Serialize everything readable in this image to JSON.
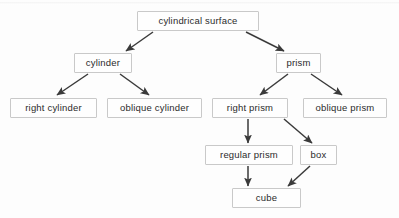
{
  "diagram": {
    "type": "hierarchy-flowchart",
    "background_color": "#fdfdfd",
    "box_border_color": "#c9c9c9",
    "box_fill_color": "#fefefe",
    "text_color": "#2b2b2b",
    "arrow_color": "#3a3a3a",
    "nodes": [
      {
        "id": "cylindrical-surface",
        "label": "cylindrical surface",
        "x": 137,
        "y": 11,
        "w": 122,
        "h": 20
      },
      {
        "id": "cylinder",
        "label": "cylinder",
        "x": 74,
        "y": 53,
        "w": 58,
        "h": 20
      },
      {
        "id": "prism",
        "label": "prism",
        "x": 276,
        "y": 53,
        "w": 45,
        "h": 20
      },
      {
        "id": "right-cylinder",
        "label": "right cylinder",
        "x": 10,
        "y": 98,
        "w": 87,
        "h": 20
      },
      {
        "id": "oblique-cylinder",
        "label": "oblique cylinder",
        "x": 107,
        "y": 98,
        "w": 95,
        "h": 20
      },
      {
        "id": "right-prism",
        "label": "right prism",
        "x": 212,
        "y": 98,
        "w": 76,
        "h": 20
      },
      {
        "id": "oblique-prism",
        "label": "oblique prism",
        "x": 303,
        "y": 98,
        "w": 84,
        "h": 20
      },
      {
        "id": "regular-prism",
        "label": "regular prism",
        "x": 205,
        "y": 145,
        "w": 88,
        "h": 20
      },
      {
        "id": "box",
        "label": "box",
        "x": 300,
        "y": 145,
        "w": 37,
        "h": 20
      },
      {
        "id": "cube",
        "label": "cube",
        "x": 232,
        "y": 188,
        "w": 69,
        "h": 20
      }
    ],
    "edges": [
      {
        "id": "edge-surface-cylinder",
        "from": "cylindrical-surface",
        "to": "cylinder",
        "x1": 153,
        "y1": 32,
        "x2": 126,
        "y2": 51
      },
      {
        "id": "edge-surface-prism",
        "from": "cylindrical-surface",
        "to": "prism",
        "x1": 246,
        "y1": 32,
        "x2": 284,
        "y2": 51
      },
      {
        "id": "edge-cylinder-right-cylinder",
        "from": "cylinder",
        "to": "right-cylinder",
        "x1": 88,
        "y1": 74,
        "x2": 57,
        "y2": 95
      },
      {
        "id": "edge-cylinder-oblique-cylinder",
        "from": "cylinder",
        "to": "oblique-cylinder",
        "x1": 120,
        "y1": 74,
        "x2": 149,
        "y2": 95
      },
      {
        "id": "edge-prism-right-prism",
        "from": "prism",
        "to": "right-prism",
        "x1": 288,
        "y1": 74,
        "x2": 260,
        "y2": 95
      },
      {
        "id": "edge-prism-oblique-prism",
        "from": "prism",
        "to": "oblique-prism",
        "x1": 311,
        "y1": 74,
        "x2": 342,
        "y2": 95
      },
      {
        "id": "edge-right-prism-regular-prism",
        "from": "right-prism",
        "to": "regular-prism",
        "x1": 248,
        "y1": 119,
        "x2": 248,
        "y2": 143
      },
      {
        "id": "edge-right-prism-box",
        "from": "right-prism",
        "to": "box",
        "x1": 284,
        "y1": 119,
        "x2": 312,
        "y2": 143
      },
      {
        "id": "edge-regular-prism-cube",
        "from": "regular-prism",
        "to": "cube",
        "x1": 248,
        "y1": 166,
        "x2": 248,
        "y2": 186
      },
      {
        "id": "edge-box-cube",
        "from": "box",
        "to": "cube",
        "x1": 310,
        "y1": 166,
        "x2": 288,
        "y2": 186
      }
    ]
  }
}
